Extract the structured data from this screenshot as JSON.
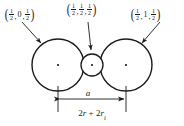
{
  "figure": {
    "background_color": "#ffffff",
    "stroke_color": "#1a1a1a",
    "labels": {
      "left": {
        "name": "left-circle-coordinate-label",
        "text": "(1/2, 0, 1/2)",
        "parts": [
          {
            "type": "paren",
            "text": "("
          },
          {
            "type": "fraction",
            "num": "1",
            "den": "2"
          },
          {
            "type": "separator",
            "text": ","
          },
          {
            "type": "whole",
            "text": "0"
          },
          {
            "type": "separator",
            "text": ","
          },
          {
            "type": "fraction",
            "num": "1",
            "den": "2"
          },
          {
            "type": "paren",
            "text": ")"
          }
        ]
      },
      "middle": {
        "name": "middle-circle-coordinate-label",
        "text": "(1/2, 1/2, 1/2)",
        "parts": [
          {
            "type": "paren",
            "text": "("
          },
          {
            "type": "fraction",
            "num": "1",
            "den": "2"
          },
          {
            "type": "separator",
            "text": ","
          },
          {
            "type": "fraction",
            "num": "1",
            "den": "2"
          },
          {
            "type": "separator",
            "text": ","
          },
          {
            "type": "fraction",
            "num": "1",
            "den": "2"
          },
          {
            "type": "paren",
            "text": ")"
          }
        ]
      },
      "right": {
        "name": "right-circle-coordinate-label",
        "text": "(1/2, 1, 1/2)",
        "parts": [
          {
            "type": "paren",
            "text": "("
          },
          {
            "type": "fraction",
            "num": "1",
            "den": "2"
          },
          {
            "type": "separator",
            "text": ","
          },
          {
            "type": "whole",
            "text": "1"
          },
          {
            "type": "separator",
            "text": ","
          },
          {
            "type": "fraction",
            "num": "1",
            "den": "2"
          },
          {
            "type": "paren",
            "text": ")"
          }
        ]
      }
    },
    "dimension": {
      "symbol": "a",
      "expression_lead": "2",
      "expression_r1": "r",
      "expression_plus": " + ",
      "expression_lead2": "2",
      "expression_r2": "r",
      "expression_sub": "i",
      "expression_full": "2r + 2ri"
    },
    "circles": [
      {
        "name": "left-circle",
        "cx": 58,
        "cy": 65,
        "r": 26,
        "center_dot": true
      },
      {
        "name": "middle-circle",
        "cx": 92,
        "cy": 65,
        "r": 11,
        "center_dot": true
      },
      {
        "name": "right-circle",
        "cx": 126,
        "cy": 65,
        "r": 26,
        "center_dot": true
      }
    ]
  }
}
